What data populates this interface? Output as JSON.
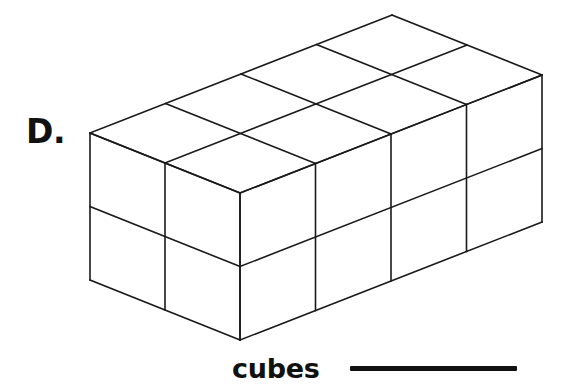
{
  "page": {
    "background_color": "#ffffff",
    "ink_color": "#111111"
  },
  "choice": {
    "label": "D."
  },
  "answer": {
    "unit_label": "cubes",
    "blank_value": ""
  },
  "figure": {
    "name": "rectangular-prism-of-unit-cubes",
    "projection": "oblique-isometric",
    "stroke_color": "#1a1a1a",
    "stroke_width": 1.6,
    "fill_color": "none",
    "dimensions": {
      "length_cubes": 4,
      "width_cubes": 2,
      "height_cubes": 2,
      "total_cubes": 16
    },
    "geometry": {
      "origin": [
        90,
        133
      ],
      "step_depth": [
        75,
        30
      ],
      "step_length": [
        75.5,
        -29.5
      ],
      "step_height": [
        0,
        73.5
      ]
    }
  }
}
